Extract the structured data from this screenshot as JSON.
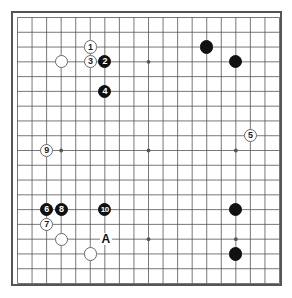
{
  "diagram": {
    "type": "go-board",
    "board_size": 19,
    "colors": {
      "board_background": "#ffffff",
      "grid_line": "#555555",
      "border": "#555555",
      "black_stone": "#111111",
      "white_stone": "#ffffff",
      "white_stone_outline": "#6a6a6a",
      "label_on_black": "#ffffff",
      "label_on_white": "#222222",
      "marker_text": "#111111"
    },
    "star_points": [
      {
        "col": 3,
        "row": 3
      },
      {
        "col": 9,
        "row": 3
      },
      {
        "col": 15,
        "row": 3
      },
      {
        "col": 3,
        "row": 9
      },
      {
        "col": 9,
        "row": 9
      },
      {
        "col": 15,
        "row": 9
      },
      {
        "col": 3,
        "row": 15
      },
      {
        "col": 9,
        "row": 15
      },
      {
        "col": 15,
        "row": 15
      }
    ],
    "stones": [
      {
        "id": "stone-white-p1",
        "color": "white",
        "label": "",
        "col": 3,
        "row": 3
      },
      {
        "id": "stone-white-1",
        "color": "white",
        "label": "1",
        "col": 5,
        "row": 2
      },
      {
        "id": "stone-white-3",
        "color": "white",
        "label": "3",
        "col": 5,
        "row": 3
      },
      {
        "id": "stone-black-2",
        "color": "black",
        "label": "2",
        "col": 6,
        "row": 3
      },
      {
        "id": "stone-black-4",
        "color": "black",
        "label": "4",
        "col": 6,
        "row": 5
      },
      {
        "id": "stone-black-p2",
        "color": "black",
        "label": "",
        "col": 13,
        "row": 2
      },
      {
        "id": "stone-black-p3",
        "color": "black",
        "label": "",
        "col": 15,
        "row": 3
      },
      {
        "id": "stone-white-5",
        "color": "white",
        "label": "5",
        "col": 16,
        "row": 8
      },
      {
        "id": "stone-white-9",
        "color": "white",
        "label": "9",
        "col": 2,
        "row": 9
      },
      {
        "id": "stone-black-6",
        "color": "black",
        "label": "6",
        "col": 2,
        "row": 13
      },
      {
        "id": "stone-black-8",
        "color": "black",
        "label": "8",
        "col": 3,
        "row": 13
      },
      {
        "id": "stone-black-10",
        "color": "black",
        "label": "10",
        "col": 6,
        "row": 13
      },
      {
        "id": "stone-black-p4",
        "color": "black",
        "label": "",
        "col": 15,
        "row": 13
      },
      {
        "id": "stone-white-7",
        "color": "white",
        "label": "7",
        "col": 2,
        "row": 14
      },
      {
        "id": "stone-white-p5",
        "color": "white",
        "label": "",
        "col": 3,
        "row": 15
      },
      {
        "id": "stone-white-p6",
        "color": "white",
        "label": "",
        "col": 5,
        "row": 16
      },
      {
        "id": "stone-black-p7",
        "color": "black",
        "label": "",
        "col": 15,
        "row": 16
      }
    ],
    "markers": [
      {
        "id": "marker-a",
        "label": "A",
        "col": 6,
        "row": 15
      }
    ]
  }
}
